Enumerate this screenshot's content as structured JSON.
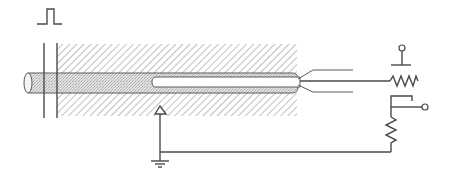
{
  "diagram": {
    "type": "schematic",
    "colors": {
      "line": "#4a4a4a",
      "hatch": "#8a8a8a",
      "stipple": "#d4d4d4",
      "background": "#ffffff"
    },
    "components": [
      {
        "id": "pulse-symbol",
        "label": ""
      },
      {
        "id": "probe-cylinder",
        "label": ""
      },
      {
        "id": "hatched-block",
        "label": ""
      },
      {
        "id": "inner-rod",
        "label": ""
      },
      {
        "id": "fanout-leads",
        "label": ""
      },
      {
        "id": "resistor-top",
        "label": ""
      },
      {
        "id": "terminal-top",
        "label": ""
      },
      {
        "id": "potentiometer",
        "label": ""
      },
      {
        "id": "terminal-right",
        "label": ""
      },
      {
        "id": "arrow-up",
        "label": ""
      },
      {
        "id": "ground",
        "label": ""
      }
    ]
  }
}
